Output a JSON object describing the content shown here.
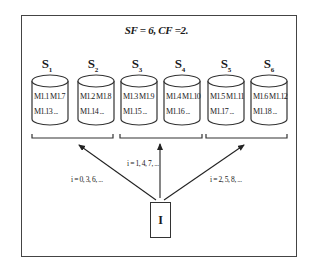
{
  "title": "SF = 6, CF =2.",
  "servers": [
    {
      "name": "S",
      "sub": "1",
      "line1": "M1.1 M1.7",
      "line2": "M1.13 ..."
    },
    {
      "name": "S",
      "sub": "2",
      "line1": "M1.2  M1.8",
      "line2": "M1.14 ..."
    },
    {
      "name": "S",
      "sub": "3",
      "line1": "M1.3 M1.9",
      "line2": "M1.15 ..."
    },
    {
      "name": "S",
      "sub": "4",
      "line1": "M1.4 M1.10",
      "line2": "M1.16 ..."
    },
    {
      "name": "S",
      "sub": "5",
      "line1": "M1.5 M1.11",
      "line2": "M1.17 ..."
    },
    {
      "name": "S",
      "sub": "6",
      "line1": "M1.6 M1.12",
      "line2": "M1.18 ..."
    }
  ],
  "arrows": [
    {
      "label": "i = 0, 3, 6, ..."
    },
    {
      "label": "i = 1, 4, 7, ..."
    },
    {
      "label": "i = 2, 5, 8, ..."
    }
  ],
  "source": {
    "label": "I"
  }
}
